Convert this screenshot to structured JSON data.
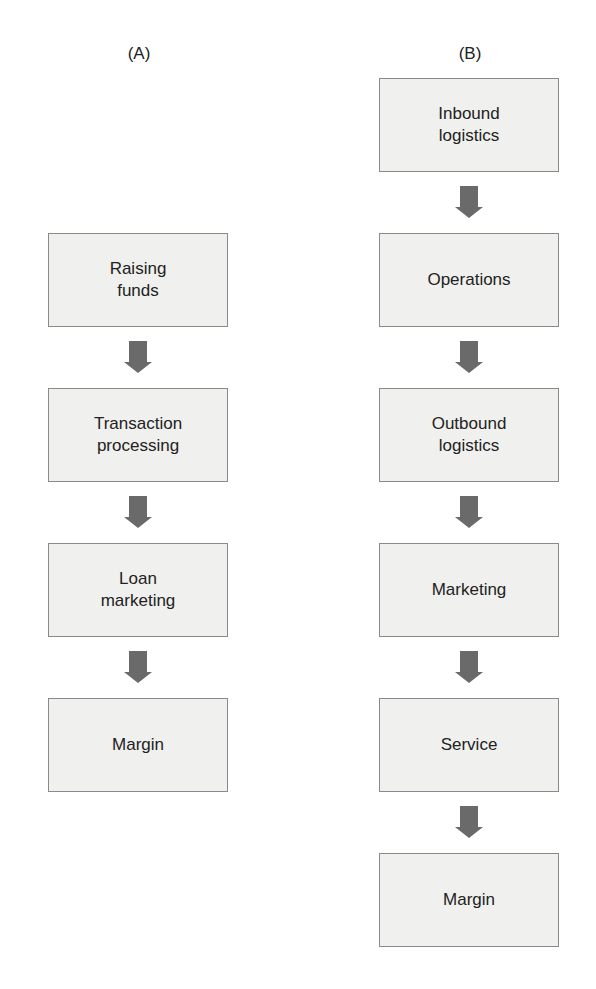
{
  "diagram": {
    "columns": [
      {
        "label": "(A)",
        "steps": [
          "Raising\nfunds",
          "Transaction\nprocessing",
          "Loan\nmarketing",
          "Margin"
        ]
      },
      {
        "label": "(B)",
        "steps": [
          "Inbound\nlogistics",
          "Operations",
          "Outbound\nlogistics",
          "Marketing",
          "Service",
          "Margin"
        ]
      }
    ],
    "colors": {
      "box_fill": "#f0f0ee",
      "box_border": "#8a8a8a",
      "arrow": "#6a6a6a"
    }
  }
}
